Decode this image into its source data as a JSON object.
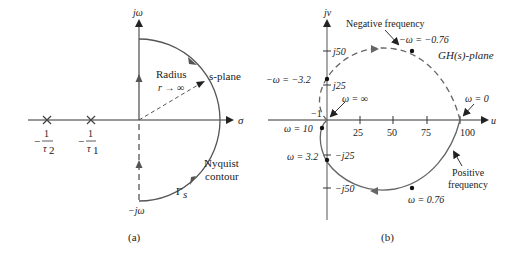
{
  "panel_a": {
    "caption": "(a)",
    "axis_imag_label": "jω",
    "axis_imag_neg_label": "−jω",
    "axis_real_label": "σ",
    "plane_label": "s-plane",
    "radius_label": "Radius",
    "radius_expr": "r → ∞",
    "contour_label_1": "Nyquist",
    "contour_label_2": "contour",
    "contour_symbol": "Γ",
    "contour_subscript": "s",
    "poles": [
      {
        "num": "1",
        "den": "τ",
        "den_sub": "2",
        "sign": "−"
      },
      {
        "num": "1",
        "den": "τ",
        "den_sub": "1",
        "sign": "−"
      }
    ]
  },
  "panel_b": {
    "caption": "(b)",
    "axis_imag_label": "jv",
    "axis_real_label": "u",
    "plane_label": "GH(s)-plane",
    "x_ticks": [
      "25",
      "50",
      "75",
      "100"
    ],
    "y_ticks_pos": [
      "j50",
      "j25"
    ],
    "y_ticks_neg": [
      "−j25",
      "−j50"
    ],
    "minus_one_label": "−1",
    "annotations": {
      "negative_frequency": "Negative frequency",
      "positive_frequency_1": "Positive",
      "positive_frequency_2": "frequency",
      "w_inf": "ω = ∞",
      "w_zero": "ω = 0",
      "w_10": "ω = 10",
      "w_3_2": "ω = 3.2",
      "w_0_76": "ω = 0.76",
      "neg_w_3_2": "−ω = −3.2",
      "neg_w_0_76": "−ω = −0.76"
    }
  }
}
